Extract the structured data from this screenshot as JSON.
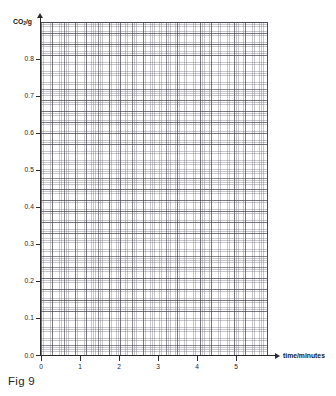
{
  "figure": {
    "caption": "Fig 9"
  },
  "chart_data": {
    "type": "line",
    "title": "",
    "subtitle": "",
    "xlabel": "time/minutes",
    "ylabel": "CO₂/g",
    "ylabel_parts": {
      "prefix": "CO",
      "subscript": "2",
      "suffix": "/g"
    },
    "xlim": [
      0,
      5.8
    ],
    "ylim": [
      0,
      0.9
    ],
    "x_ticks": [
      0,
      1,
      2,
      3,
      4,
      5
    ],
    "x_tick_labels": [
      "0",
      "1",
      "2",
      "3",
      "4",
      "5"
    ],
    "y_ticks": [
      0.0,
      0.1,
      0.2,
      0.3,
      0.4,
      0.5,
      0.6,
      0.7,
      0.8
    ],
    "y_tick_labels": [
      "0.0",
      "0.1",
      "0.2",
      "0.3",
      "0.4",
      "0.5",
      "0.6",
      "0.7",
      "0.8"
    ],
    "grid": true,
    "grid_style": "graph-paper",
    "minor_divisions_per_major": 5,
    "major_grid_x_step": 0.25,
    "major_grid_y_step": 0.03,
    "legend": [],
    "legend_position": "none",
    "series": [],
    "annotations": [],
    "note": "Blank graph-paper axes with no plotted data series",
    "colors": {
      "axis": "#2a2a2a",
      "major_gridline": "#46464f",
      "minor_gridline": "#787884",
      "background": "#ffffff",
      "text": "#1c1c1c"
    }
  }
}
